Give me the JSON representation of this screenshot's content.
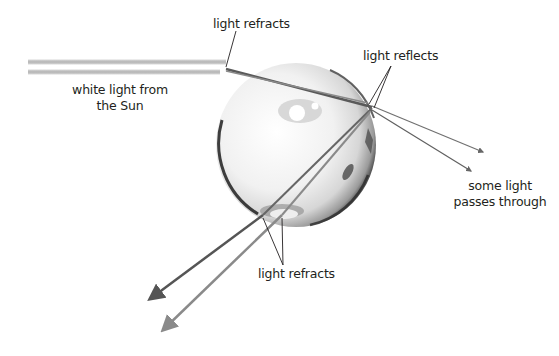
{
  "diagram": {
    "labels": {
      "top_refract": "light refracts",
      "reflects": "light reflects",
      "sunlight_line1": "white light from",
      "sunlight_line2": "the Sun",
      "passes_line1": "some light",
      "passes_line2": "passes through",
      "bottom_refract": "light refracts"
    },
    "elements": {
      "sphere": "water-droplet",
      "incoming_beam": "sunlight-beam",
      "rays": [
        "refracted-ray",
        "reflected-ray",
        "transmitted-ray",
        "exit-ray"
      ]
    },
    "colors": {
      "text": "#231f20",
      "ray_dark": "#555555",
      "ray_light": "#888888",
      "beam": "#bfbfbf",
      "sphere_edge": "#2a2a2a"
    }
  }
}
